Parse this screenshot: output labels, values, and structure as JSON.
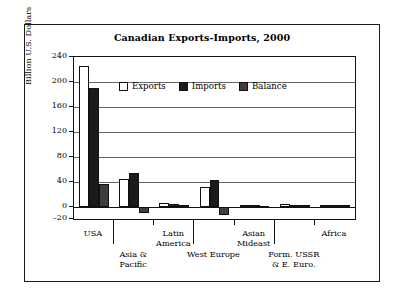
{
  "chart_data": {
    "type": "bar",
    "title": "Canadian Exports-Imports, 2000",
    "xlabel": "",
    "ylabel": "Billion U.S. Dollars",
    "ylim": [
      -20,
      240
    ],
    "yticks": [
      240,
      200,
      160,
      120,
      80,
      40,
      0,
      -20
    ],
    "ytick_labels": [
      "240",
      "200",
      "160",
      "120",
      "80",
      "40",
      "0",
      "–20"
    ],
    "grid": true,
    "legend_position": "inside-top-center",
    "categories": [
      "USA",
      "Asia & Pacific",
      "Latin America",
      "West Europe",
      "Asian Mideast",
      "Form. USSR & E. Euro.",
      "Africa"
    ],
    "category_lines": [
      [
        "USA"
      ],
      [
        "Asia &",
        "Pacific"
      ],
      [
        "Latin",
        "America"
      ],
      [
        "West Europe"
      ],
      [
        "Asian",
        "Mideast"
      ],
      [
        "Form. USSR",
        "& E. Euro."
      ],
      [
        "Africa"
      ]
    ],
    "series": [
      {
        "name": "Exports",
        "color": "#ffffff",
        "values": [
          225,
          45,
          6,
          32,
          3,
          4,
          3
        ]
      },
      {
        "name": "Imports",
        "color": "#1b1b1b",
        "values": [
          190,
          54,
          4,
          43,
          2,
          2,
          2
        ]
      },
      {
        "name": "Balance",
        "color": "#3d3d3d",
        "values": [
          36,
          -10,
          2,
          -13,
          1,
          3,
          3
        ]
      }
    ]
  },
  "legend": {
    "items": [
      {
        "label": "Exports",
        "swatch": "white-square-icon"
      },
      {
        "label": "Imports",
        "swatch": "black-square-icon"
      },
      {
        "label": "Balance",
        "swatch": "gray-square-icon"
      }
    ]
  }
}
